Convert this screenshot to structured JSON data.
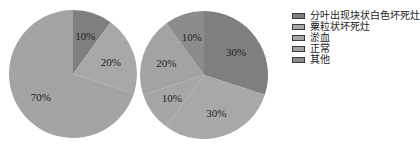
{
  "chart_data": [
    {
      "type": "pie",
      "title": "",
      "categories": [
        "分叶出现块状白色坏死灶",
        "粟粒状坏死灶",
        "淤血",
        "正常",
        "其他"
      ],
      "values": [
        10,
        20,
        70,
        0,
        0
      ],
      "labels": [
        "10%",
        "20%",
        "70%"
      ],
      "colors": [
        "#7f7f7f",
        "#a8a8a8",
        "#a4a4a4",
        "#a4a4a4",
        "#8c8c8c"
      ],
      "center": [
        73,
        74
      ],
      "radius": 64
    },
    {
      "type": "pie",
      "title": "",
      "categories": [
        "分叶出现块状白色坏死灶",
        "粟粒状坏死灶",
        "淤血",
        "正常",
        "其他"
      ],
      "values": [
        30,
        30,
        10,
        20,
        10
      ],
      "labels": [
        "30%",
        "30%",
        "10%",
        "20%",
        "10%"
      ],
      "colors": [
        "#7f7f7f",
        "#a8a8a8",
        "#a6a6a6",
        "#a3a3a3",
        "#8c8c8c"
      ],
      "center": [
        204,
        75
      ],
      "radius": 64
    }
  ],
  "legend": {
    "position": "right",
    "items": [
      {
        "label": "分叶出现块状白色坏死灶",
        "color": "#7f7f7f"
      },
      {
        "label": "粟粒状坏死灶",
        "color": "#a8a8a8"
      },
      {
        "label": "淤血",
        "color": "#a6a6a6"
      },
      {
        "label": "正常",
        "color": "#a3a3a3"
      },
      {
        "label": "其他",
        "color": "#8c8c8c"
      }
    ]
  }
}
